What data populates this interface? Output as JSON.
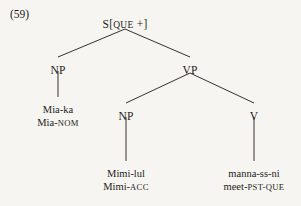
{
  "figure": {
    "example_number": "(59)",
    "type": "syntax-tree",
    "language_note": "Korean",
    "ink_color": "#1d1c1a",
    "background_color": "#f7f5f1"
  },
  "tree": {
    "root": {
      "id": "s-node",
      "label_main": "S[",
      "label_feature": "QUE",
      "label_tail": " +]",
      "label_full": "S[QUE +]",
      "x": 125,
      "y": 18
    },
    "nodes": [
      {
        "id": "np-subject",
        "label": "NP",
        "x": 58,
        "y": 64
      },
      {
        "id": "vp",
        "label": "VP",
        "x": 190,
        "y": 64
      },
      {
        "id": "np-object",
        "label": "NP",
        "x": 126,
        "y": 110
      },
      {
        "id": "v",
        "label": "V",
        "x": 254,
        "y": 110
      }
    ],
    "leaves": [
      {
        "id": "leaf-subject",
        "surface": "Mia-ka",
        "gloss_stem": "Mia-",
        "gloss_feature": "NOM",
        "gloss_full": "Mia-NOM",
        "x": 58,
        "y": 104
      },
      {
        "id": "leaf-object",
        "surface": "Mimi-lul",
        "gloss_stem": "Mimi-",
        "gloss_feature": "ACC",
        "gloss_full": "Mimi-ACC",
        "x": 126,
        "y": 168
      },
      {
        "id": "leaf-verb",
        "surface": "manna-ss-ni",
        "gloss_stem": "meet-",
        "gloss_feature": "PST-QUE",
        "gloss_full": "meet-PST-QUE",
        "x": 254,
        "y": 168
      }
    ],
    "edges": [
      {
        "id": "edge-s-np",
        "from": "s-node",
        "to": "np-subject",
        "x1": 125,
        "y1": 29,
        "x2": 58,
        "y2": 57
      },
      {
        "id": "edge-s-vp",
        "from": "s-node",
        "to": "vp",
        "x1": 125,
        "y1": 29,
        "x2": 190,
        "y2": 57
      },
      {
        "id": "edge-np-subject-leaf",
        "from": "np-subject",
        "to": "leaf-subject",
        "x1": 58,
        "y1": 71,
        "x2": 58,
        "y2": 97
      },
      {
        "id": "edge-vp-np",
        "from": "vp",
        "to": "np-object",
        "x1": 190,
        "y1": 73,
        "x2": 126,
        "y2": 103
      },
      {
        "id": "edge-vp-v",
        "from": "vp",
        "to": "v",
        "x1": 190,
        "y1": 73,
        "x2": 254,
        "y2": 103
      },
      {
        "id": "edge-np-object-leaf",
        "from": "np-object",
        "to": "leaf-object",
        "x1": 126,
        "y1": 117,
        "x2": 126,
        "y2": 161
      },
      {
        "id": "edge-v-leaf",
        "from": "v",
        "to": "leaf-verb",
        "x1": 254,
        "y1": 117,
        "x2": 254,
        "y2": 161
      }
    ]
  }
}
